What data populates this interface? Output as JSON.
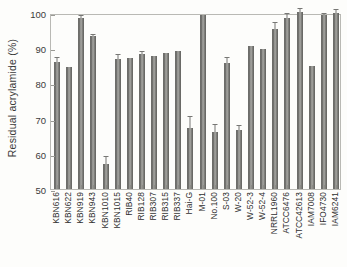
{
  "chart_data": {
    "type": "bar",
    "title": "",
    "xlabel": "",
    "ylabel": "Residual acrylamide  (%)",
    "ylim": [
      50,
      100
    ],
    "yticks": [
      50,
      60,
      70,
      80,
      90,
      100
    ],
    "grid": false,
    "legend": "none",
    "categories": [
      "KBN616",
      "KBN622",
      "KBN919",
      "KBN943",
      "KBN1010",
      "KBN1015",
      "RIB40",
      "RIB128",
      "RIB307",
      "RIB315",
      "RIB337",
      "Hai-G",
      "M-01",
      "No.100",
      "S-03",
      "W-20",
      "W-52-3",
      "W-52-4",
      "NRRL1960",
      "ATCC6476",
      "ATCC42613",
      "IAM7008",
      "IFO4730",
      "IAM6241"
    ],
    "values": [
      86.2,
      84.8,
      98.6,
      93.4,
      57.0,
      86.9,
      87.1,
      88.3,
      87.8,
      88.5,
      89.1,
      67.4,
      99.4,
      66.3,
      85.9,
      66.7,
      90.6,
      89.9,
      95.4,
      98.5,
      100.2,
      85.0,
      99.4,
      100.1
    ],
    "errors": [
      0.9,
      0.0,
      0.5,
      0.4,
      2.2,
      1.2,
      0.0,
      0.5,
      0.0,
      0.0,
      0.0,
      3.1,
      0.0,
      1.9,
      1.4,
      1.2,
      0.0,
      0.0,
      1.8,
      1.3,
      0.8,
      0.0,
      0.4,
      0.7
    ],
    "bar_color": "#6f6f6c",
    "frame_color": "#b9b9b4",
    "background": "#fdfdfb"
  }
}
